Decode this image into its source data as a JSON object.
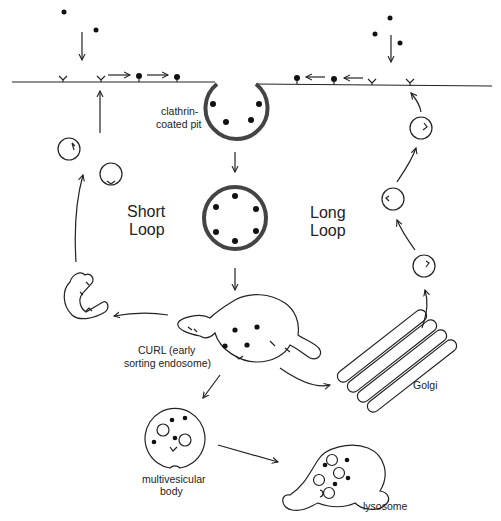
{
  "diagram": {
    "type": "receptor-mediated endocytosis pathway",
    "labels": {
      "pit_line1": "clathrin-",
      "pit_line2": "coated pit",
      "short_loop_1": "Short",
      "short_loop_2": "Loop",
      "long_loop_1": "Long",
      "long_loop_2": "Loop",
      "curl_line1": "CURL (early",
      "curl_line2": "sorting endosome)",
      "golgi": "Golgi",
      "mvb_line1": "multivesicular",
      "mvb_line2": "body",
      "lysosome": "lysosome"
    },
    "nodes": [
      {
        "id": "plasma-membrane",
        "label": ""
      },
      {
        "id": "clathrin-coated-pit",
        "label": "clathrin-coated pit"
      },
      {
        "id": "coated-vesicle",
        "label": ""
      },
      {
        "id": "curl",
        "label": "CURL (early sorting endosome)"
      },
      {
        "id": "recycling-tubule",
        "label": ""
      },
      {
        "id": "golgi",
        "label": "Golgi"
      },
      {
        "id": "multivesicular-body",
        "label": "multivesicular body"
      },
      {
        "id": "lysosome",
        "label": "lysosome"
      }
    ],
    "edges": [
      {
        "from": "ligand",
        "to": "plasma-membrane"
      },
      {
        "from": "plasma-membrane",
        "to": "clathrin-coated-pit"
      },
      {
        "from": "clathrin-coated-pit",
        "to": "coated-vesicle"
      },
      {
        "from": "coated-vesicle",
        "to": "curl"
      },
      {
        "from": "curl",
        "to": "recycling-tubule",
        "loop": "Short Loop"
      },
      {
        "from": "recycling-tubule",
        "to": "plasma-membrane",
        "loop": "Short Loop"
      },
      {
        "from": "curl",
        "to": "golgi",
        "loop": "Long Loop"
      },
      {
        "from": "golgi",
        "to": "plasma-membrane",
        "loop": "Long Loop"
      },
      {
        "from": "curl",
        "to": "multivesicular-body"
      },
      {
        "from": "multivesicular-body",
        "to": "lysosome"
      }
    ]
  }
}
